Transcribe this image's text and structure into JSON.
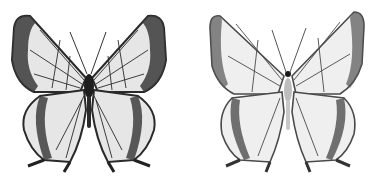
{
  "image": {
    "description": "Two grayscale butterfly specimens side by side",
    "background": "#ffffff",
    "specimens": [
      {
        "view": "dorsal",
        "tone": "dark",
        "wing_fill": "#e6e6e6",
        "vein_color": "#2a2a2a",
        "margin_color": "#3a3a3a"
      },
      {
        "view": "ventral",
        "tone": "light",
        "wing_fill": "#efefef",
        "vein_color": "#4a4a4a",
        "margin_color": "#6a6a6a"
      }
    ]
  }
}
